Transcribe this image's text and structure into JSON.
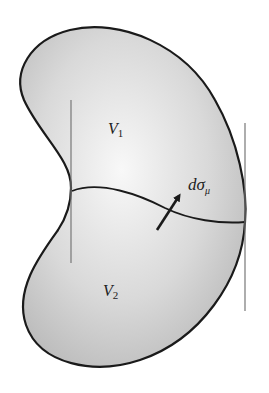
{
  "diagram": {
    "colors": {
      "fill_light": "#f6f6f6",
      "fill_dark": "#bdbdbd",
      "outline": "#1a1a1a",
      "guide_line": "#777777"
    },
    "labels": {
      "volume_1": {
        "base": "V",
        "sub": "1"
      },
      "volume_2": {
        "base": "V",
        "sub": "2"
      },
      "surface_element": {
        "base": "dσ",
        "sub": "μ"
      }
    },
    "arrow": {
      "from": [
        157,
        230
      ],
      "to": [
        181,
        193
      ]
    },
    "guide_lines": {
      "left": {
        "x": 71,
        "y1": 100,
        "y2": 263
      },
      "right": {
        "x": 245,
        "y1": 123,
        "y2": 311
      }
    }
  }
}
